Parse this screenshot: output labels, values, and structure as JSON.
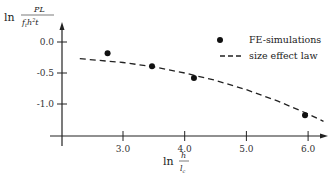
{
  "chart_data": {
    "type": "scatter",
    "title": "",
    "xlabel": "ln h/l_c",
    "ylabel": "ln PL/(f_t h^2 t)",
    "xlabel_parts": {
      "prefix": "ln",
      "num": "h",
      "den": "l_c"
    },
    "ylabel_parts": {
      "prefix": "ln",
      "num": "PL",
      "den": "f_t h^2 t"
    },
    "x_ticks": [
      "3.0",
      "4.0",
      "5.0",
      "6.0"
    ],
    "y_ticks": [
      "0.0",
      "-0.5",
      "-1.0"
    ],
    "xlim": [
      2.0,
      6.25
    ],
    "ylim": [
      -1.75,
      0.1
    ],
    "grid": false,
    "legend_position": "upper right",
    "series": [
      {
        "name": "FE-simulations",
        "style": "markers",
        "x": [
          2.75,
          3.47,
          4.15,
          5.95
        ],
        "y": [
          -0.18,
          -0.39,
          -0.58,
          -1.18
        ]
      },
      {
        "name": "size effect law",
        "style": "dashed line",
        "x": [
          2.3,
          3.0,
          3.5,
          4.0,
          4.5,
          5.0,
          5.5,
          6.0,
          6.25
        ],
        "y": [
          -0.27,
          -0.33,
          -0.4,
          -0.5,
          -0.62,
          -0.77,
          -0.95,
          -1.16,
          -1.28
        ]
      }
    ]
  },
  "legend": {
    "item1": "FE-simulations",
    "item2": "size effect law"
  },
  "axes": {
    "y_prefix": "ln",
    "y_num": "PL",
    "y_den": "f",
    "x_prefix": "ln",
    "x_num": "h",
    "x_den": "l"
  }
}
